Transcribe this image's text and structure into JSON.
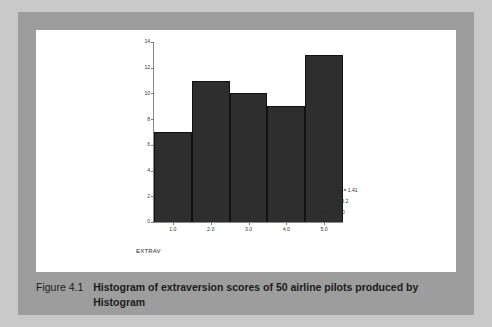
{
  "figure": {
    "caption_label": "Figure 4.1",
    "caption_text": "Histogram of extraversion scores of 50 airline pilots produced by Histogram"
  },
  "chart_data": {
    "type": "bar",
    "title": "",
    "subtitle": "",
    "xlabel": "EXTRAV",
    "ylabel": "",
    "categories": [
      "1.0",
      "2.0",
      "3.0",
      "4.0",
      "5.0"
    ],
    "x": [
      1.0,
      2.0,
      3.0,
      4.0,
      5.0
    ],
    "values": [
      7,
      11,
      10,
      9,
      13
    ],
    "xlim": [
      0.5,
      5.5
    ],
    "ylim": [
      0,
      14
    ],
    "yticks": [
      0,
      2,
      4,
      6,
      8,
      10,
      12,
      14
    ],
    "ytick_labels": [
      "0",
      "2",
      "4",
      "6",
      "8",
      "10",
      "12",
      "14"
    ],
    "xticks": [
      1.0,
      2.0,
      3.0,
      4.0,
      5.0
    ],
    "xtick_labels": [
      "1.0",
      "2.0",
      "3.0",
      "4.0",
      "5.0"
    ],
    "grid": false,
    "legend": "none",
    "bar_color": "#2e2e2e",
    "annotations": [
      "Std. Dev = 1.41",
      "Mean = 3.2",
      "N = 50.00"
    ]
  },
  "stats": {
    "std_dev": "Std. Dev = 1.41",
    "mean": "Mean = 3.2",
    "n": "N = 50.00"
  },
  "colors": {
    "page_background": "#c9c9c9",
    "frame": "#9d9d9d",
    "panel": "#ffffff",
    "bar": "#2e2e2e",
    "axis": "#8a8a8a",
    "text": "#1b1b1b"
  }
}
